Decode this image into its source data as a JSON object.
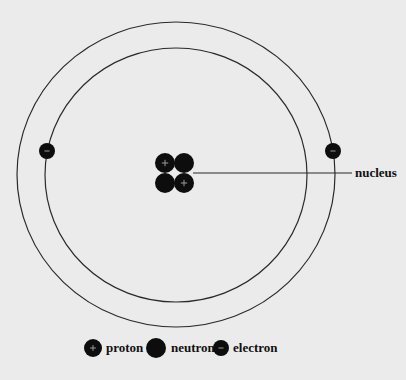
{
  "diagram": {
    "type": "atom-model",
    "colors": {
      "background": "#ebebeb",
      "stroke": "#2a2a2a",
      "particle": "#0d0d0d",
      "particle_mark": "#9a9a9a"
    },
    "orbits": [
      {
        "name": "inner-orbit",
        "cx": 176,
        "cy": 175,
        "rx": 131,
        "ry": 127
      },
      {
        "name": "outer-orbit",
        "cx": 176,
        "cy": 174.5,
        "rx": 159,
        "ry": 152.5
      }
    ],
    "nucleus": {
      "label": "nucleus",
      "particles": [
        {
          "type": "proton",
          "cx": 165,
          "cy": 163,
          "r": 10
        },
        {
          "type": "neutron",
          "cx": 184,
          "cy": 163,
          "r": 10
        },
        {
          "type": "neutron",
          "cx": 165,
          "cy": 183,
          "r": 10
        },
        {
          "type": "proton",
          "cx": 184,
          "cy": 183,
          "r": 10
        }
      ],
      "pointer_line": {
        "x1": 193,
        "y1": 173,
        "x2": 352,
        "y2": 173
      },
      "label_pos": {
        "x": 355,
        "y": 177
      }
    },
    "electrons": [
      {
        "name": "electron-left",
        "cx": 47,
        "cy": 151,
        "r": 8
      },
      {
        "name": "electron-right",
        "cx": 333,
        "cy": 151,
        "r": 8
      }
    ],
    "legend": {
      "items": [
        {
          "name": "proton",
          "label": "proton",
          "icon_type": "proton",
          "cx": 93,
          "cy": 348,
          "r": 9,
          "text_x": 106
        },
        {
          "name": "neutron",
          "label": "neutron",
          "icon_type": "neutron",
          "cx": 156,
          "cy": 348,
          "r": 10,
          "text_x": 171
        },
        {
          "name": "electron",
          "label": "electron",
          "icon_type": "electron",
          "cx": 221,
          "cy": 348,
          "r": 8,
          "text_x": 233
        }
      ]
    }
  }
}
